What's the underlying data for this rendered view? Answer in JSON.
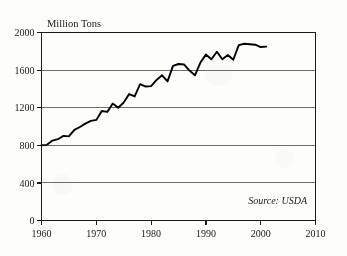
{
  "chart_data": {
    "type": "line",
    "title": "",
    "xlabel": "",
    "ylabel": "Million Tons",
    "ylim": [
      0,
      2000
    ],
    "xlim": [
      1960,
      2010
    ],
    "yticks": [
      0,
      400,
      800,
      1200,
      1600,
      2000
    ],
    "ytick_labels": [
      "0",
      "400",
      "800",
      "1200",
      "1600",
      "2000"
    ],
    "xticks": [
      1960,
      1970,
      1980,
      1990,
      2000,
      2010
    ],
    "xtick_labels": [
      "1960",
      "1970",
      "1980",
      "1990",
      "2000",
      "2010"
    ],
    "grid": "horizontal",
    "legend": "none",
    "annotation": "Source: USDA",
    "series": [
      {
        "name": "Grain Production",
        "x": [
          1960,
          1961,
          1962,
          1963,
          1964,
          1965,
          1966,
          1967,
          1968,
          1969,
          1970,
          1971,
          1972,
          1973,
          1974,
          1975,
          1976,
          1977,
          1978,
          1979,
          1980,
          1981,
          1982,
          1983,
          1984,
          1985,
          1986,
          1987,
          1988,
          1989,
          1990,
          1991,
          1992,
          1993,
          1994,
          1995,
          1996,
          1997,
          1998,
          1999,
          2000,
          2001
        ],
        "values": [
          800,
          805,
          850,
          865,
          900,
          895,
          965,
          995,
          1030,
          1060,
          1070,
          1165,
          1155,
          1245,
          1200,
          1255,
          1345,
          1320,
          1450,
          1425,
          1430,
          1495,
          1545,
          1480,
          1645,
          1665,
          1660,
          1595,
          1545,
          1680,
          1765,
          1715,
          1795,
          1715,
          1760,
          1710,
          1865,
          1880,
          1875,
          1870,
          1845,
          1850
        ]
      }
    ]
  },
  "axes": {
    "y_axis_title": "Million Tons",
    "source_label": "Source: USDA"
  }
}
